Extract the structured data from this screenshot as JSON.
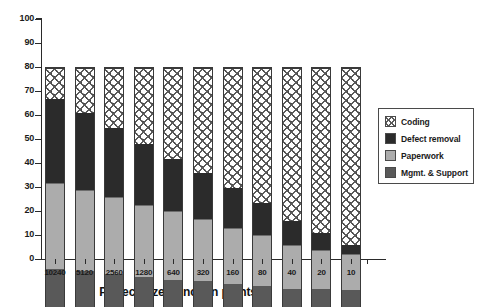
{
  "chart_data": {
    "type": "bar",
    "subtype": "stacked-bar-100-percent",
    "title": "",
    "xlabel": "Project size (function points)",
    "ylabel": "",
    "ylim": [
      0,
      100
    ],
    "yticks": [
      0,
      10,
      20,
      30,
      40,
      50,
      60,
      70,
      80,
      90,
      100
    ],
    "grid": false,
    "legend_position": "right",
    "categories": [
      "10240",
      "5120",
      "2560",
      "1280",
      "640",
      "320",
      "160",
      "80",
      "40",
      "20",
      "10"
    ],
    "series": [
      {
        "name": "Mgmt. & Support",
        "color": "#595959",
        "values": [
          16,
          15,
          14,
          12.5,
          11.5,
          11,
          9.5,
          9,
          7.5,
          7.5,
          7
        ]
      },
      {
        "name": "Paperwork",
        "color": "#acacac",
        "values": [
          36,
          34,
          32,
          30,
          28.5,
          26,
          23.5,
          21,
          18.5,
          16.5,
          15
        ]
      },
      {
        "name": "Defect removal",
        "color": "#2b2b2b",
        "values": [
          35,
          32,
          29,
          25.5,
          22,
          19,
          17,
          13.5,
          10,
          7,
          4
        ]
      },
      {
        "name": "Coding",
        "color": "#ffffff",
        "values": [
          13,
          19,
          25,
          32,
          38,
          44,
          50,
          56.5,
          64,
          69,
          74
        ]
      }
    ],
    "stack_tops": {
      "mgmt": [
        16,
        15,
        14,
        12.5,
        11.5,
        11,
        9.5,
        9,
        7.5,
        7.5,
        7
      ],
      "paper": [
        52,
        49,
        46,
        42.5,
        40,
        37,
        33,
        30,
        26,
        24,
        22
      ],
      "defect": [
        87,
        81,
        75,
        68,
        62,
        56,
        50,
        43.5,
        36,
        31,
        26
      ],
      "coding": [
        100,
        100,
        100,
        100,
        100,
        100,
        100,
        100,
        100,
        100,
        100
      ]
    }
  },
  "legend": {
    "items": [
      {
        "label": "Coding",
        "swatch": "coding"
      },
      {
        "label": "Defect removal",
        "swatch": "defect"
      },
      {
        "label": "Paperwork",
        "swatch": "paper"
      },
      {
        "label": "Mgmt. & Support",
        "swatch": "mgmt"
      }
    ]
  },
  "axes": {
    "x_title": "Project size (function points)",
    "y_tick_labels": [
      "100",
      "90",
      "80",
      "70",
      "60",
      "50",
      "40",
      "30",
      "20",
      "10",
      "0"
    ]
  }
}
